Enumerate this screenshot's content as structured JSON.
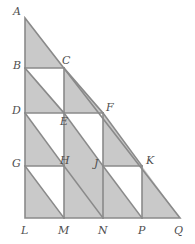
{
  "figure": {
    "colors": {
      "shaded_fill": "#c9c9c9",
      "unshaded_fill": "#ffffff",
      "stroke": "#8a8a8a",
      "label_color": "#4f4f4f",
      "background": "#ffffff"
    },
    "triangle": {
      "name": "ALQ",
      "apex": "A",
      "right_angle_vertex": "L",
      "base_end": "Q"
    },
    "labels": [
      {
        "id": "A",
        "text": "A",
        "x": 13,
        "y": 6
      },
      {
        "id": "B",
        "text": "B",
        "x": 13,
        "y": 60
      },
      {
        "id": "C",
        "text": "C",
        "x": 62,
        "y": 55
      },
      {
        "id": "D",
        "text": "D",
        "x": 12,
        "y": 105
      },
      {
        "id": "E",
        "text": "E",
        "x": 60,
        "y": 116
      },
      {
        "id": "F",
        "text": "F",
        "x": 106,
        "y": 102
      },
      {
        "id": "G",
        "text": "G",
        "x": 12,
        "y": 158
      },
      {
        "id": "H",
        "text": "H",
        "x": 60,
        "y": 155
      },
      {
        "id": "J",
        "text": "J",
        "x": 94,
        "y": 158
      },
      {
        "id": "K",
        "text": "K",
        "x": 146,
        "y": 155
      },
      {
        "id": "L",
        "text": "L",
        "x": 21,
        "y": 225
      },
      {
        "id": "M",
        "text": "M",
        "x": 58,
        "y": 225
      },
      {
        "id": "N",
        "text": "N",
        "x": 98,
        "y": 225
      },
      {
        "id": "P",
        "text": "P",
        "x": 138,
        "y": 225
      },
      {
        "id": "Q",
        "text": "Q",
        "x": 174,
        "y": 225
      }
    ],
    "points": {
      "A": [
        25,
        18
      ],
      "B": [
        25,
        68
      ],
      "C": [
        64,
        68
      ],
      "D": [
        25,
        113
      ],
      "E": [
        64,
        113
      ],
      "F": [
        103,
        113
      ],
      "G": [
        25,
        166
      ],
      "H": [
        64,
        166
      ],
      "J": [
        103,
        166
      ],
      "K": [
        142,
        166
      ],
      "L": [
        25,
        218
      ],
      "M": [
        64,
        218
      ],
      "N": [
        103,
        218
      ],
      "P": [
        142,
        218
      ],
      "Q": [
        180,
        218
      ]
    },
    "shaded_regions": [
      {
        "name": "triangle-A-B-C",
        "polygon": "25,18 64,68 25,68"
      },
      {
        "name": "triangle-B-E-D",
        "polygon": "25,68 64,113 25,113"
      },
      {
        "name": "triangle-C-F-E",
        "polygon": "64,68 103,113 64,113"
      },
      {
        "name": "triangle-D-H-G",
        "polygon": "25,113 64,166 25,166"
      },
      {
        "name": "triangle-E-N-H-plus",
        "polygon": "64,113 103,166 103,218 64,218"
      },
      {
        "name": "triangle-F-K-J",
        "polygon": "103,113 142,166 103,166"
      },
      {
        "name": "triangle-G-M-L",
        "polygon": "25,166 64,218 25,218"
      },
      {
        "name": "triangle-J-P-N",
        "polygon": "103,166 142,218 103,218"
      },
      {
        "name": "triangle-K-Q-P",
        "polygon": "142,166 180,218 142,218"
      }
    ],
    "outline_paths": [
      {
        "name": "triangle-outline",
        "d": "M25,18 L180,218 L25,218 Z"
      },
      {
        "name": "segment-B-C",
        "d": "M25,68 L64,68"
      },
      {
        "name": "segment-D-F",
        "d": "M25,113 L103,113"
      },
      {
        "name": "segment-G-H",
        "d": "M25,166 L64,166"
      },
      {
        "name": "segment-J-K",
        "d": "M103,166 L142,166"
      },
      {
        "name": "segment-C-E",
        "d": "M64,68 L64,113"
      },
      {
        "name": "segment-E-M",
        "d": "M64,113 L64,218"
      },
      {
        "name": "segment-F-N",
        "d": "M103,113 L103,218"
      },
      {
        "name": "segment-K-P",
        "d": "M142,166 L142,218"
      },
      {
        "name": "diagonal-B-E",
        "d": "M25,68 L64,113"
      },
      {
        "name": "diagonal-C-F",
        "d": "M64,68 L103,113"
      },
      {
        "name": "diagonal-D-H",
        "d": "M25,113 L64,166"
      },
      {
        "name": "diagonal-G-M",
        "d": "M25,166 L64,218"
      },
      {
        "name": "diagonal-E-N",
        "d": "M64,113 L103,166"
      },
      {
        "name": "diagonal-H-N",
        "d": "M64,166 L103,218"
      },
      {
        "name": "diagonal-F-K",
        "d": "M103,113 L142,166"
      },
      {
        "name": "diagonal-J-P",
        "d": "M103,166 L142,218"
      }
    ]
  }
}
